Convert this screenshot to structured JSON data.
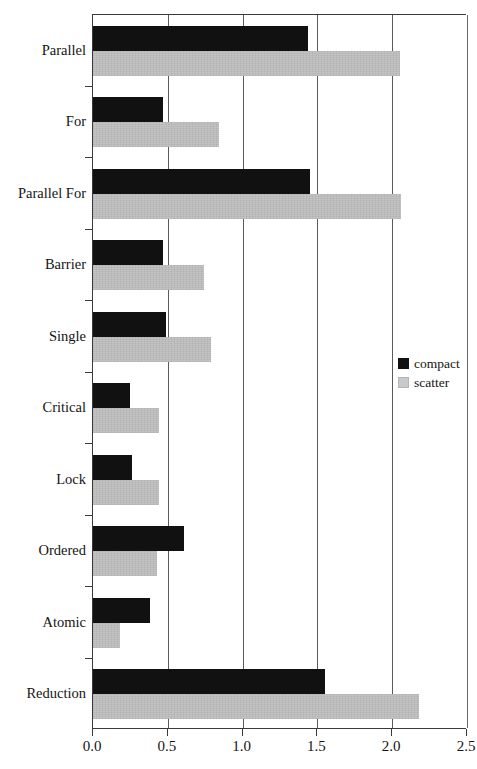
{
  "chart_data": {
    "type": "bar",
    "orientation": "horizontal",
    "title": "",
    "xlabel": "",
    "ylabel": "",
    "xlim": [
      0.0,
      2.5
    ],
    "xticks": [
      "0.0",
      "0.5",
      "1.0",
      "1.5",
      "2.0",
      "2.5"
    ],
    "xtick_values": [
      0.0,
      0.5,
      1.0,
      1.5,
      2.0,
      2.5
    ],
    "grid": "vertical",
    "legend_position": "right-middle",
    "categories": [
      "Parallel",
      "For",
      "Parallel For",
      "Barrier",
      "Single",
      "Critical",
      "Lock",
      "Ordered",
      "Atomic",
      "Reduction"
    ],
    "series": [
      {
        "name": "compact",
        "color": "#111111",
        "values": [
          1.44,
          0.47,
          1.45,
          0.47,
          0.49,
          0.25,
          0.26,
          0.61,
          0.38,
          1.55
        ]
      },
      {
        "name": "scatter",
        "color": "#c9c9c9",
        "values": [
          2.05,
          0.84,
          2.06,
          0.74,
          0.79,
          0.44,
          0.44,
          0.43,
          0.18,
          2.18
        ]
      }
    ]
  },
  "legend": {
    "entries": [
      {
        "label": "compact",
        "swatch": "black-square-icon"
      },
      {
        "label": "scatter",
        "swatch": "gray-square-icon"
      }
    ]
  }
}
